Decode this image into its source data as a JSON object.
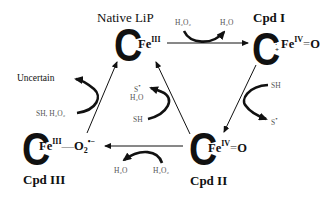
{
  "diagram": {
    "type": "catalytic-cycle",
    "nodes": {
      "native": {
        "label": "Native LiP",
        "iron": "Fe",
        "oxidation": "III",
        "ligand": ""
      },
      "cpd1": {
        "label": "Cpd I",
        "radical": "•+",
        "iron": "Fe",
        "oxidation": "IV",
        "bond": "=",
        "ligand": "O"
      },
      "cpd2": {
        "label": "Cpd II",
        "iron": "Fe",
        "oxidation": "IV",
        "bond": "=",
        "ligand": "O"
      },
      "cpd3": {
        "label": "Cpd III",
        "iron": "Fe",
        "oxidation": "III",
        "bond": "—",
        "ligand": "O",
        "ligand_sub": "2",
        "ligand_sup": "•−"
      }
    },
    "heme_glyph": "C",
    "edges": [
      {
        "from": "native",
        "to": "cpd1",
        "in": "H₂O₂",
        "out": "H₂O"
      },
      {
        "from": "cpd1",
        "to": "cpd2",
        "in": "SH",
        "out": "S•"
      },
      {
        "from": "cpd2",
        "to": "native",
        "in": "SH",
        "out1": "S•",
        "out2": "H₂O"
      },
      {
        "from": "cpd2",
        "to": "cpd3",
        "in": "H₂O₂",
        "out": "H₂O"
      },
      {
        "from": "cpd3",
        "to": "native",
        "in": "SH, H₂O₂",
        "out": "Uncertain"
      }
    ],
    "labels": {
      "uncertain": "Uncertain",
      "h2o2": "H₂O₂",
      "h2o": "H₂O",
      "sh": "SH",
      "s_radical": "S",
      "radical_dot": "•",
      "sh_h2o2": "SH, H₂O₂"
    }
  }
}
